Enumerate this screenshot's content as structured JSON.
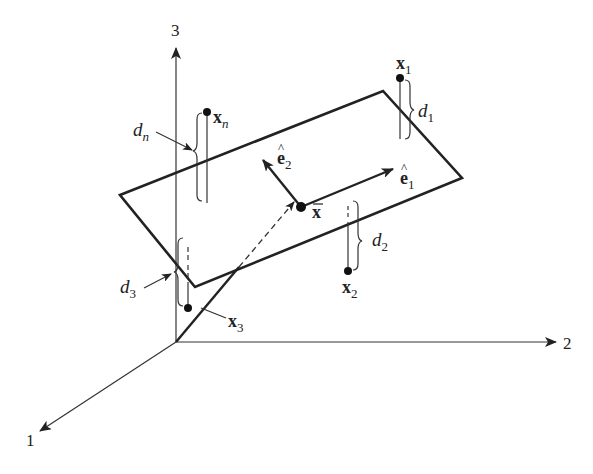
{
  "axes": {
    "axis1_label": "1",
    "axis2_label": "2",
    "axis3_label": "3"
  },
  "points": {
    "x1": {
      "base": "x",
      "sub": "1"
    },
    "x2": {
      "base": "x",
      "sub": "2"
    },
    "x3": {
      "base": "x",
      "sub": "3"
    },
    "xn": {
      "base": "x",
      "sub": "n"
    },
    "mean": {
      "base": "x",
      "bar": true
    }
  },
  "distances": {
    "d1": {
      "base": "d",
      "sub": "1"
    },
    "d2": {
      "base": "d",
      "sub": "2"
    },
    "d3": {
      "base": "d",
      "sub": "3"
    },
    "dn": {
      "base": "d",
      "sub": "n"
    }
  },
  "vectors": {
    "e1": {
      "base": "e",
      "hat": "^",
      "sub": "1"
    },
    "e2": {
      "base": "e",
      "hat": "^",
      "sub": "2"
    }
  },
  "colors": {
    "ink": "#222222",
    "background": "#ffffff"
  }
}
